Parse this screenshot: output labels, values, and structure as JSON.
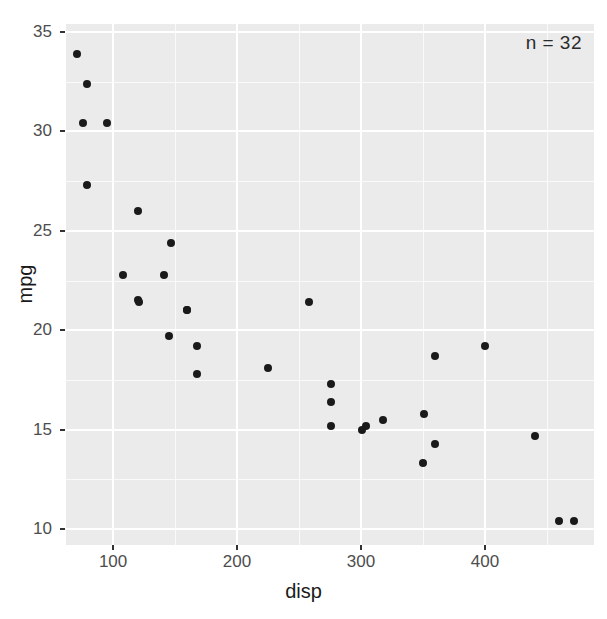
{
  "chart_data": {
    "type": "scatter",
    "title": "",
    "xlabel": "disp",
    "ylabel": "mpg",
    "xlim": [
      62,
      488
    ],
    "ylim": [
      9.2,
      35.4
    ],
    "grid": true,
    "legend": false,
    "annotations": [
      {
        "text": "n = 32",
        "position": "top-right"
      }
    ],
    "x_ticks": [
      100,
      200,
      300,
      400
    ],
    "x_tick_labels": [
      "100",
      "200",
      "300",
      "400"
    ],
    "x_minor_ticks": [
      50,
      150,
      250,
      350,
      450
    ],
    "y_ticks": [
      10,
      15,
      20,
      25,
      30,
      35
    ],
    "y_tick_labels": [
      "10",
      "15",
      "20",
      "25",
      "30",
      "35"
    ],
    "y_minor_ticks": [
      12.5,
      17.5,
      22.5,
      27.5,
      32.5
    ],
    "point_color": "#1a1a1a",
    "panel_color": "#ebebeb",
    "grid_color": "#ffffff",
    "n_points": 32,
    "series": [
      {
        "name": "mtcars",
        "x": [
          160,
          160,
          108,
          258,
          360,
          225,
          360,
          146.7,
          140.8,
          167.6,
          167.6,
          275.8,
          275.8,
          275.8,
          472,
          460,
          440,
          78.7,
          75.7,
          71.1,
          120.1,
          318,
          304,
          350,
          400,
          79,
          120.3,
          95.1,
          351,
          145,
          301,
          121
        ],
        "y": [
          21.0,
          21.0,
          22.8,
          21.4,
          18.7,
          18.1,
          14.3,
          24.4,
          22.8,
          19.2,
          17.8,
          16.4,
          17.3,
          15.2,
          10.4,
          10.4,
          14.7,
          32.4,
          30.4,
          33.9,
          21.5,
          15.5,
          15.2,
          13.3,
          19.2,
          27.3,
          26.0,
          30.4,
          15.8,
          19.7,
          15.0,
          21.4
        ]
      }
    ]
  },
  "axis": {
    "x_title": "disp",
    "y_title": "mpg"
  }
}
